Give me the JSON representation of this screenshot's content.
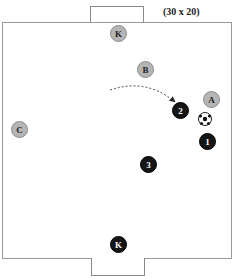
{
  "diagram": {
    "field_size_label": "(30 x 20)",
    "colors": {
      "attacking_team": "#b5b5b5",
      "defending_team": "#151515",
      "field_line": "#9a9a9a"
    },
    "players": [
      {
        "id": "gk-top",
        "label": "K",
        "team": "grey",
        "x": 118,
        "y": 33
      },
      {
        "id": "b",
        "label": "B",
        "team": "grey",
        "x": 145,
        "y": 69
      },
      {
        "id": "a",
        "label": "A",
        "team": "grey",
        "x": 211,
        "y": 99
      },
      {
        "id": "c",
        "label": "C",
        "team": "grey",
        "x": 19,
        "y": 129
      },
      {
        "id": "p2",
        "label": "2",
        "team": "black",
        "x": 180,
        "y": 110
      },
      {
        "id": "p1",
        "label": "1",
        "team": "black",
        "x": 207,
        "y": 141
      },
      {
        "id": "p3",
        "label": "3",
        "team": "black",
        "x": 148,
        "y": 164
      },
      {
        "id": "gk-bottom",
        "label": "K",
        "team": "black",
        "x": 118,
        "y": 244
      }
    ],
    "ball": {
      "icon": "soccer-ball-icon",
      "x": 205,
      "y": 119
    },
    "arrow": {
      "type": "dashed-curved",
      "from": [
        110,
        90
      ],
      "to": [
        174,
        101
      ]
    }
  }
}
